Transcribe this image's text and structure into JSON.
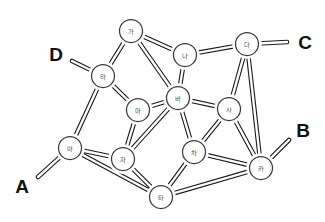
{
  "diagram": {
    "type": "node-link-diagram",
    "background_color": "#ffffff",
    "edge_color": "#1a1a1a",
    "node_fill_color": "#ffffff",
    "node_stroke_color": "#3a3a3a",
    "node_label_color": "#4a4a4a",
    "terminal_label_color": "#111111",
    "node_radius": 11.5,
    "nodes": [
      {
        "id": "ga",
        "label": "가",
        "x": 131,
        "y": 31
      },
      {
        "id": "na",
        "label": "나",
        "x": 185,
        "y": 55
      },
      {
        "id": "da",
        "label": "다",
        "x": 247,
        "y": 44
      },
      {
        "id": "ra",
        "label": "라",
        "x": 103,
        "y": 76
      },
      {
        "id": "ma",
        "label": "마",
        "x": 138,
        "y": 110
      },
      {
        "id": "ba",
        "label": "바",
        "x": 178,
        "y": 98
      },
      {
        "id": "sa",
        "label": "사",
        "x": 229,
        "y": 109
      },
      {
        "id": "a",
        "label": "아",
        "x": 70,
        "y": 148
      },
      {
        "id": "ja",
        "label": "자",
        "x": 123,
        "y": 159
      },
      {
        "id": "cha",
        "label": "차",
        "x": 194,
        "y": 152
      },
      {
        "id": "ka",
        "label": "카",
        "x": 261,
        "y": 168
      },
      {
        "id": "ta",
        "label": "타",
        "x": 161,
        "y": 197
      }
    ],
    "edges": [
      {
        "from": "ga",
        "to": "na"
      },
      {
        "from": "ga",
        "to": "ra"
      },
      {
        "from": "ga",
        "to": "ba"
      },
      {
        "from": "na",
        "to": "da"
      },
      {
        "from": "na",
        "to": "ba"
      },
      {
        "from": "da",
        "to": "sa"
      },
      {
        "from": "da",
        "to": "ka"
      },
      {
        "from": "ra",
        "to": "ma"
      },
      {
        "from": "ra",
        "to": "a"
      },
      {
        "from": "ma",
        "to": "ba"
      },
      {
        "from": "ma",
        "to": "ja"
      },
      {
        "from": "ba",
        "to": "sa"
      },
      {
        "from": "ba",
        "to": "cha"
      },
      {
        "from": "ba",
        "to": "ja"
      },
      {
        "from": "sa",
        "to": "cha"
      },
      {
        "from": "sa",
        "to": "ka"
      },
      {
        "from": "a",
        "to": "ja"
      },
      {
        "from": "a",
        "to": "ta"
      },
      {
        "from": "ja",
        "to": "ta"
      },
      {
        "from": "cha",
        "to": "ta"
      },
      {
        "from": "cha",
        "to": "ka"
      },
      {
        "from": "ta",
        "to": "ka"
      }
    ],
    "terminals": [
      {
        "id": "A",
        "label": "A",
        "label_x": 22,
        "label_y": 186,
        "node": "a",
        "end_x": 38,
        "end_y": 177
      },
      {
        "id": "B",
        "label": "B",
        "label_x": 303,
        "label_y": 130,
        "node": "ka",
        "end_x": 289,
        "end_y": 140
      },
      {
        "id": "C",
        "label": "C",
        "label_x": 305,
        "label_y": 42,
        "node": "da",
        "end_x": 287,
        "end_y": 42
      },
      {
        "id": "D",
        "label": "D",
        "label_x": 56,
        "label_y": 54,
        "node": "ra",
        "end_x": 72,
        "end_y": 61
      }
    ]
  }
}
